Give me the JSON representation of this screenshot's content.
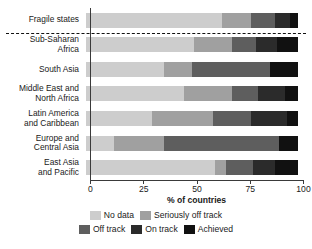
{
  "chart_data": {
    "type": "bar",
    "orientation": "horizontal",
    "stacked": true,
    "title": "",
    "xlabel": "% of countries",
    "ylabel": "",
    "xlim": [
      0,
      100
    ],
    "xticks": [
      0,
      25,
      50,
      75,
      100
    ],
    "xtick_labels": [
      "0",
      "25",
      "50",
      "75",
      "100"
    ],
    "grid": false,
    "legend_position": "bottom",
    "units": "percent",
    "categories": [
      "Fragile states",
      "Sub-Saharan\nAfrica",
      "South Asia",
      "Middle East and\nNorth Africa",
      "Latin America\nand Caribbean",
      "Europe and\nCentral Asia",
      "East Asia\nand Pacific"
    ],
    "series": [
      {
        "name": "No data",
        "color": "#cdcdcd",
        "values": [
          64,
          51,
          37,
          46,
          31,
          13,
          61
        ]
      },
      {
        "name": "Seriously off track",
        "color": "#a0a0a0",
        "values": [
          14,
          18,
          13,
          23,
          29,
          24,
          5
        ]
      },
      {
        "name": "Off track",
        "color": "#5e5e5e",
        "values": [
          11,
          11,
          37,
          12,
          18,
          54,
          13
        ]
      },
      {
        "name": "On track",
        "color": "#2b2b2b",
        "values": [
          7,
          10,
          0,
          13,
          17,
          0,
          10
        ]
      },
      {
        "name": "Achieved",
        "color": "#111111",
        "values": [
          4,
          10,
          13,
          6,
          5,
          9,
          11
        ]
      }
    ],
    "annotations": [
      {
        "type": "dashed-divider",
        "below_category": "Fragile states",
        "note": "dashed line separating Fragile states from regional groups"
      }
    ]
  },
  "legend": {
    "row1": [
      {
        "label": "No data",
        "color": "#cdcdcd"
      },
      {
        "label": "Seriously off track",
        "color": "#a0a0a0"
      }
    ],
    "row2": [
      {
        "label": "Off track",
        "color": "#5e5e5e"
      },
      {
        "label": "On track",
        "color": "#2b2b2b"
      },
      {
        "label": "Achieved",
        "color": "#111111"
      }
    ]
  }
}
